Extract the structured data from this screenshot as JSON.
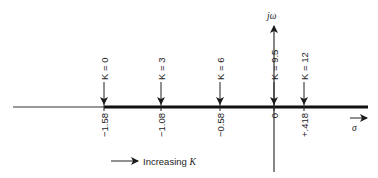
{
  "diagram": {
    "type": "root-locus",
    "axes": {
      "real_axis_label": "σ",
      "imag_axis_label": "jω"
    },
    "locus_points": [
      {
        "gain_label": "K = 0",
        "value_label": "−1.58",
        "x": 104
      },
      {
        "gain_label": "K = 3",
        "value_label": "−1.08",
        "x": 161
      },
      {
        "gain_label": "K = 6",
        "value_label": "−0.58",
        "x": 220
      },
      {
        "gain_label": "K = 9.5",
        "value_label": "0",
        "x": 274
      },
      {
        "gain_label": "K = 12",
        "value_label": "+.418",
        "x": 304
      }
    ],
    "legend": {
      "text": "Increasing ",
      "k": "K"
    }
  }
}
